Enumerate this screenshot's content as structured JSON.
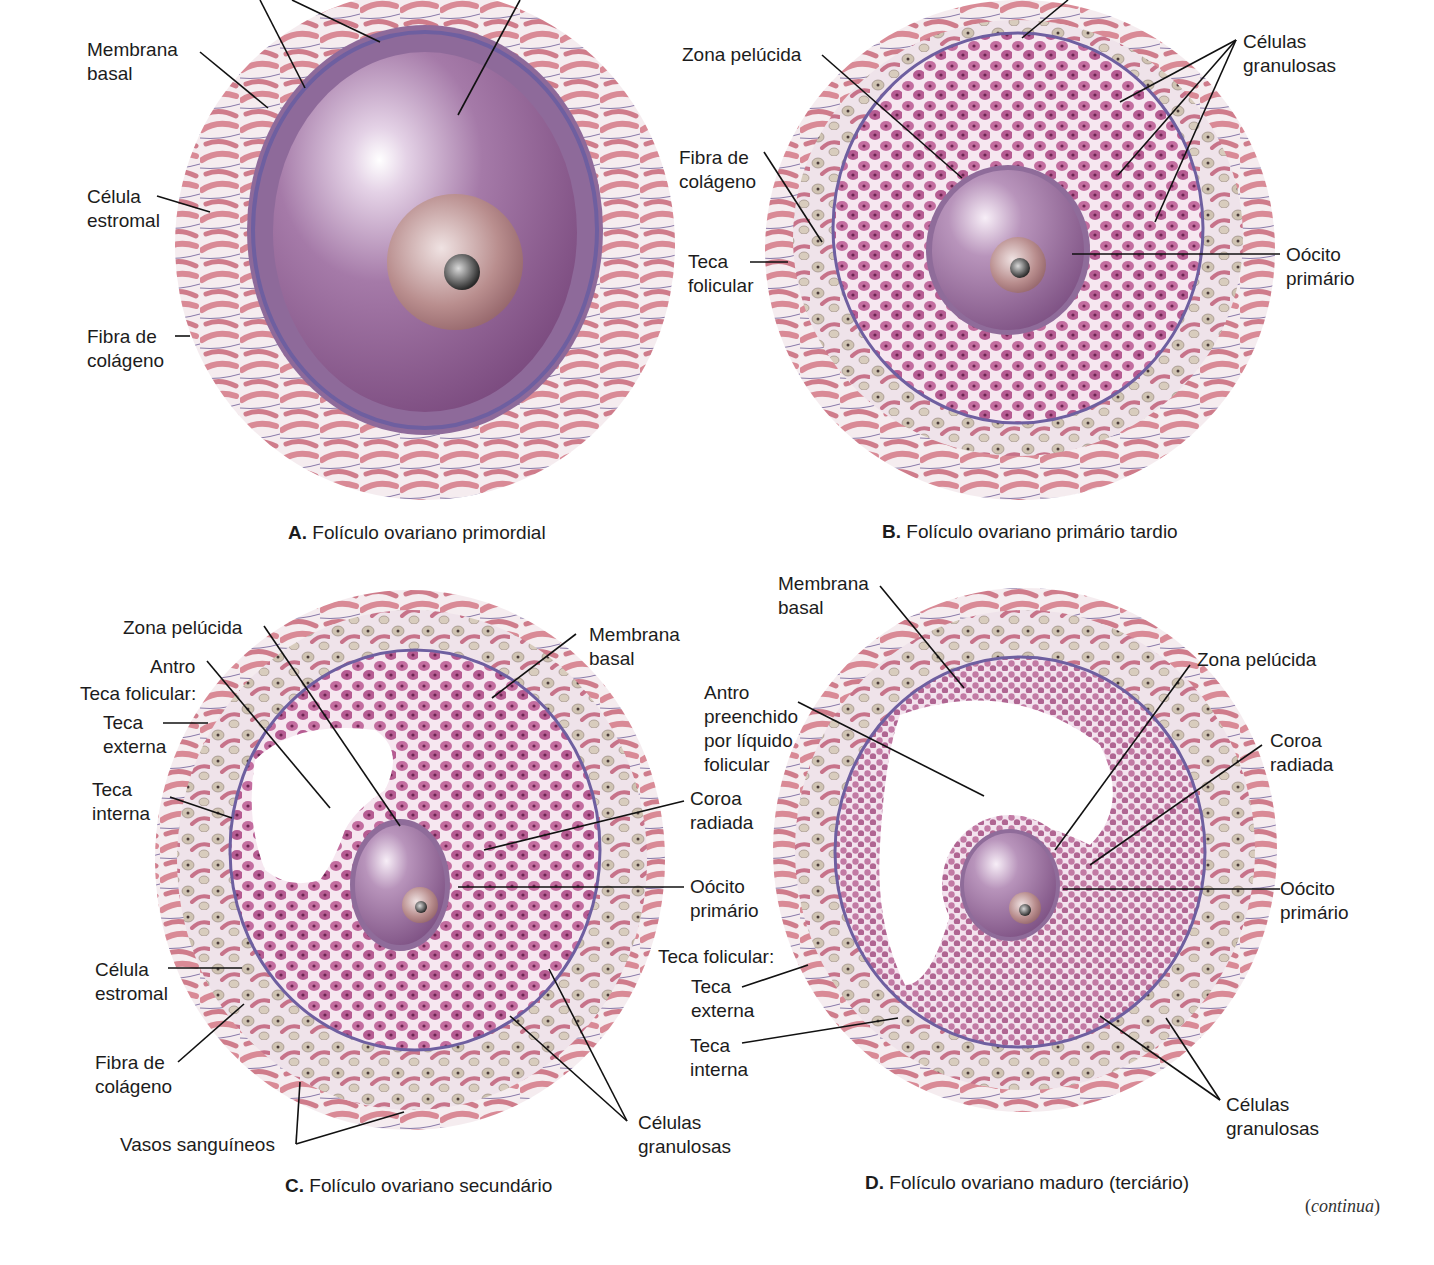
{
  "figure": {
    "panels": [
      {
        "id": "A",
        "caption_letter": "A.",
        "caption_text": " Folículo ovariano primordial",
        "labels": {
          "membrana_basal": "Membrana\nbasal",
          "celula_estromal": "Célula\nestromal",
          "fibra_colageno": "Fibra de\ncolágeno"
        }
      },
      {
        "id": "B",
        "caption_letter": "B.",
        "caption_text": " Folículo ovariano primário tardio",
        "labels": {
          "zona_pelucida": "Zona pelúcida",
          "fibra_colageno": "Fibra de\ncolágeno",
          "teca_folicular": "Teca\nfolicular",
          "celulas_granulosas": "Células\ngranulosas",
          "oocito_primario": "Oócito\nprimário"
        }
      },
      {
        "id": "C",
        "caption_letter": "C.",
        "caption_text": " Folículo ovariano secundário",
        "labels": {
          "zona_pelucida": "Zona pelúcida",
          "antro": "Antro",
          "teca_folicular": "Teca folicular:",
          "teca_externa": "Teca\nexterna",
          "teca_interna": "Teca\ninterna",
          "celula_estromal": "Célula\nestromal",
          "fibra_colageno": "Fibra de\ncolágeno",
          "vasos_sanguineos": "Vasos sanguíneos",
          "membrana_basal": "Membrana\nbasal",
          "coroa_radiada": "Coroa\nradiada",
          "oocito_primario": "Oócito\nprimário",
          "celulas_granulosas": "Células\ngranulosas"
        }
      },
      {
        "id": "D",
        "caption_letter": "D.",
        "caption_text": " Folículo ovariano maduro (terciário)",
        "labels": {
          "membrana_basal": "Membrana\nbasal",
          "antro": "Antro\npreenchido\npor líquido\nfolicular",
          "teca_folicular": "Teca folicular:",
          "teca_externa": "Teca\nexterna",
          "teca_interna": "Teca\ninterna",
          "zona_pelucida": "Zona pelúcida",
          "coroa_radiada": "Coroa\nradiada",
          "oocito_primario": "Oócito\nprimário",
          "celulas_granulosas": "Células\ngranulosas"
        }
      }
    ],
    "continuation_note": "continua",
    "colors": {
      "stroma_cell": "#d98a96",
      "granulosa": "#b0568e",
      "oocyte": "#9a6a9c",
      "basal_membrane": "#6e5fa0",
      "blood_vessel": "#e0582a",
      "theca_cell": "#cfc3b2"
    }
  }
}
